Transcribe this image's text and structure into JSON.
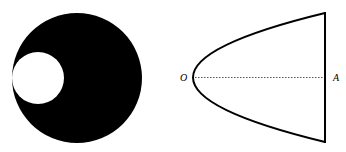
{
  "figures": [
    {
      "id": "disk-with-hole",
      "description": "Solid black disk with a smaller white circular hole tangent to its left edge",
      "outer_circle": {
        "cx": 77,
        "cy": 78,
        "r": 65,
        "fill": "#000000"
      },
      "inner_circle": {
        "cx": 38,
        "cy": 78,
        "r": 26,
        "fill": "#ffffff"
      }
    },
    {
      "id": "parabolic-segment",
      "description": "Parabolic segment with vertex O and axis OA drawn dotted, closed by a vertical chord through A",
      "labels": {
        "vertex": "O",
        "axis_end": "A"
      },
      "stroke_color": "#000000"
    }
  ]
}
